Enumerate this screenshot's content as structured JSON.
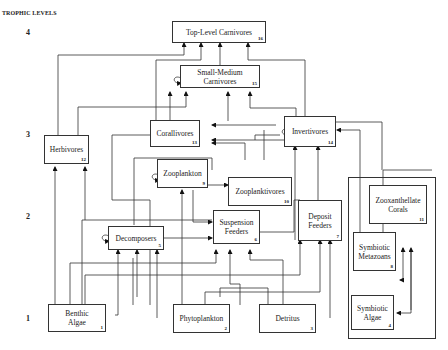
{
  "title": "TROPHIC LEVELS",
  "levels": [
    "4",
    "3",
    "2",
    "1"
  ],
  "nodes": {
    "top_level_carnivores": {
      "label": "Top-Level Carnivores",
      "num": "16"
    },
    "small_medium_carnivores": {
      "label": "Small-Medium Carnivores",
      "num": "15"
    },
    "herbivores": {
      "label": "Herbivores",
      "num": "12"
    },
    "corallivores": {
      "label": "Corallivores",
      "num": "13"
    },
    "invertivores": {
      "label": "Invertivores",
      "num": "14"
    },
    "zooplankton": {
      "label": "Zooplankton",
      "num": "9"
    },
    "zooplanktivores": {
      "label": "Zooplanktivores",
      "num": "10"
    },
    "decomposers": {
      "label": "Decomposers",
      "num": "5"
    },
    "suspension_feeders": {
      "label": "Suspension Feeders",
      "num": "6"
    },
    "deposit_feeders": {
      "label": "Deposit Feeders",
      "num": "7"
    },
    "zooxanthellate_corals": {
      "label": "Zooxanthellate Corals",
      "num": "11"
    },
    "symbiotic_metazoans": {
      "label": "Symbiotic Metazoans",
      "num": "8"
    },
    "symbiotic_algae": {
      "label": "Symbiotic Algae",
      "num": "4"
    },
    "benthic_algae": {
      "label": "Benthic Algae",
      "num": "1"
    },
    "phytoplankton": {
      "label": "Phytoplankton",
      "num": "2"
    },
    "detritus": {
      "label": "Detritus",
      "num": "3"
    }
  }
}
